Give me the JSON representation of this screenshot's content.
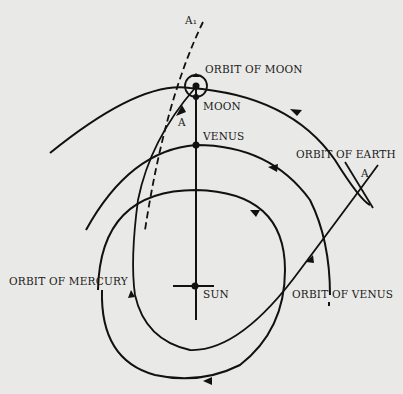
{
  "diagram": {
    "type": "orbital diagram",
    "labels": {
      "a1": "A₁",
      "a_upper": "A",
      "a_right": "A",
      "orbit_of_moon": "ORBIT OF MOON",
      "moon": "MOON",
      "venus": "VENUS",
      "orbit_of_earth": "ORBIT OF EARTH",
      "orbit_of_mercury": "ORBIT OF MERCURY",
      "sun": "SUN",
      "orbit_of_venus": "ORBIT OF VENUS"
    },
    "bodies": [
      "Sun",
      "Venus",
      "Moon"
    ],
    "orbits": [
      "Orbit of Moon",
      "Orbit of Earth",
      "Orbit of Venus",
      "Orbit of Mercury"
    ],
    "colors": {
      "background": "#e9e9e7",
      "ink": "#111111"
    }
  }
}
